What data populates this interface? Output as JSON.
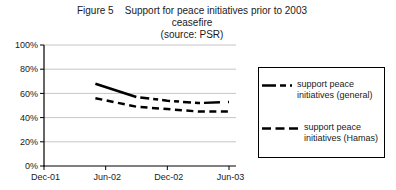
{
  "title": {
    "line1": "Figure 5    Support for peace initiatives prior to 2003",
    "line2": "ceasefire",
    "line3": "(source: PSR)"
  },
  "chart_data": {
    "type": "line",
    "title": "Figure 5  Support for peace initiatives prior to 2003 ceasefire",
    "subtitle": "(source: PSR)",
    "x_point_labels": [
      "May-02",
      "Sep-02",
      "Dec-02",
      "Mar-03",
      "Jun-03"
    ],
    "x_months_from_dec01": [
      5,
      9,
      12,
      15,
      18
    ],
    "series": [
      {
        "name": "support peace initiatives (general)",
        "values": [
          68,
          57,
          54,
          52,
          53
        ],
        "line_style": "dash-dot",
        "color": "#000000"
      },
      {
        "name": "support peace initiatives (Hamas)",
        "values": [
          56,
          49,
          47,
          45,
          45
        ],
        "line_style": "dashed",
        "color": "#000000"
      }
    ],
    "x_axis": {
      "ticks": [
        "Dec-01",
        "Jun-02",
        "Dec-02",
        "Jun-03"
      ],
      "tick_months": [
        0,
        6,
        12,
        18
      ]
    },
    "y_axis": {
      "ticks": [
        "0%",
        "20%",
        "40%",
        "60%",
        "80%",
        "100%"
      ],
      "tick_values": [
        0,
        20,
        40,
        60,
        80,
        100
      ],
      "range": [
        0,
        100
      ]
    },
    "grid": "horizontal",
    "legend_position": "right",
    "colors": {
      "series": "#000000",
      "gridline": "#c6c6c6",
      "axis": "#000000",
      "background": "#ffffff"
    }
  }
}
